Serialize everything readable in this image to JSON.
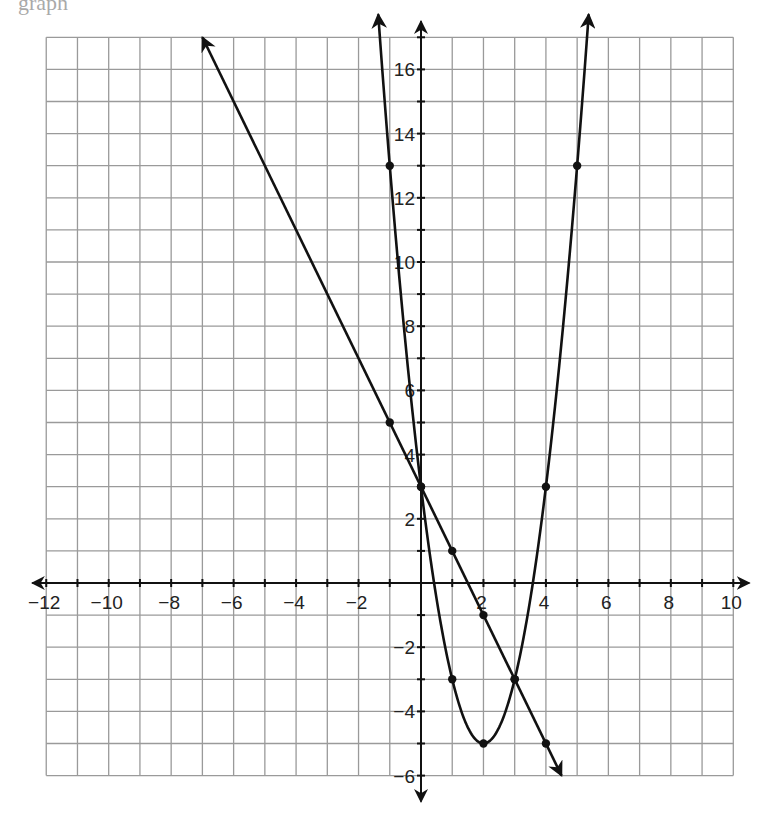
{
  "page": {
    "top_fragment": "graph"
  },
  "chart_data": {
    "type": "line",
    "title": "",
    "xlabel": "",
    "ylabel": "",
    "xlim": [
      -12,
      10
    ],
    "ylim": [
      -6,
      17
    ],
    "grid": true,
    "x_tick_labels": [
      "-12",
      "-10",
      "-8",
      "-6",
      "-4",
      "-2",
      "2",
      "4",
      "6",
      "8",
      "10"
    ],
    "y_tick_labels": [
      "16",
      "14",
      "12",
      "10",
      "8",
      "6",
      "4",
      "2",
      "-2",
      "-4",
      "-6"
    ],
    "series": [
      {
        "name": "line",
        "equation": "y = -2x + 3",
        "kind": "line",
        "endpoints": [
          [
            -7,
            17
          ],
          [
            4.5,
            -6
          ]
        ],
        "marked_points": [
          [
            -1,
            5
          ],
          [
            0,
            3
          ],
          [
            1,
            1
          ],
          [
            2,
            -1
          ],
          [
            3,
            -3
          ],
          [
            4,
            -5
          ]
        ]
      },
      {
        "name": "parabola",
        "equation": "y = 2x^2 - 8x + 3",
        "kind": "parabola",
        "x_range": [
          -1.37,
          5.37
        ],
        "marked_points": [
          [
            -1,
            13
          ],
          [
            0,
            3
          ],
          [
            1,
            -3
          ],
          [
            2,
            -5
          ],
          [
            3,
            -3
          ],
          [
            4,
            3
          ],
          [
            5,
            13
          ]
        ]
      }
    ]
  }
}
